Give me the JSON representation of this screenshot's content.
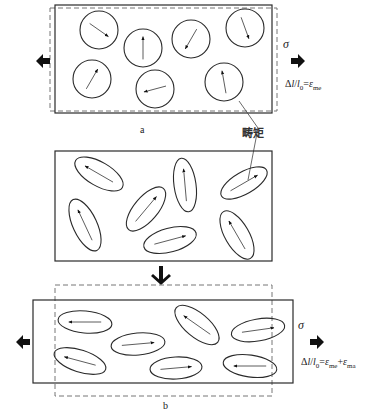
{
  "figure": {
    "colors": {
      "stroke": "#2a2a2a",
      "arrow": "#111111",
      "dash": "#777777",
      "background": "#ffffff"
    },
    "panel_a": {
      "label": "a",
      "stress_symbol": "σ",
      "strain_eq": {
        "prefix": "Δ",
        "l": "l",
        "slash": "/",
        "l0": "l",
        "l0_sub": "0",
        "eq": "=",
        "eps": "ε",
        "eps_sub": "me"
      },
      "rect_solid": [
        55,
        5,
        217,
        108
      ],
      "rect_dashed": [
        50,
        8,
        227,
        103
      ],
      "domains": [
        {
          "cx": 99,
          "cy": 30,
          "rx": 19,
          "ry": 19,
          "rot": 0,
          "angle": 35
        },
        {
          "cx": 143,
          "cy": 48,
          "rx": 19,
          "ry": 19,
          "rot": 0,
          "angle": -90
        },
        {
          "cx": 191,
          "cy": 39,
          "rx": 19,
          "ry": 19,
          "rot": 0,
          "angle": 120
        },
        {
          "cx": 245,
          "cy": 28,
          "rx": 19,
          "ry": 19,
          "rot": 0,
          "angle": 70
        },
        {
          "cx": 92,
          "cy": 79,
          "rx": 19,
          "ry": 19,
          "rot": 0,
          "angle": -60
        },
        {
          "cx": 155,
          "cy": 89,
          "rx": 19,
          "ry": 19,
          "rot": 0,
          "angle": 165
        },
        {
          "cx": 224,
          "cy": 82,
          "rx": 19,
          "ry": 19,
          "rot": 0,
          "angle": -100
        }
      ]
    },
    "annotation": {
      "text": "畴矩",
      "leader": [
        [
          239,
          101
        ],
        [
          258,
          128
        ],
        [
          248,
          180
        ]
      ]
    },
    "panel_middle": {
      "rect_solid": [
        55,
        151,
        217,
        110
      ],
      "domains": [
        {
          "cx": 99,
          "cy": 174,
          "rx": 27,
          "ry": 12,
          "rot": 30,
          "angle": 210
        },
        {
          "cx": 146,
          "cy": 209,
          "rx": 27,
          "ry": 12,
          "rot": -50,
          "angle": -50
        },
        {
          "cx": 185,
          "cy": 185,
          "rx": 27,
          "ry": 11,
          "rot": 82,
          "angle": -95
        },
        {
          "cx": 244,
          "cy": 183,
          "rx": 26,
          "ry": 11,
          "rot": -30,
          "angle": -30
        },
        {
          "cx": 85,
          "cy": 225,
          "rx": 28,
          "ry": 12,
          "rot": 65,
          "angle": -115
        },
        {
          "cx": 170,
          "cy": 240,
          "rx": 27,
          "ry": 12,
          "rot": -15,
          "angle": -15
        },
        {
          "cx": 237,
          "cy": 235,
          "rx": 27,
          "ry": 12,
          "rot": 60,
          "angle": -120
        }
      ]
    },
    "transition_arrow": {
      "x": 161,
      "y1": 266,
      "y2": 283
    },
    "panel_b": {
      "label": "b",
      "stress_symbol": "σ",
      "strain_eq": {
        "prefix": "Δ",
        "l": "l",
        "slash": "/",
        "l0": "l",
        "l0_sub": "0",
        "eq": "=",
        "eps": "ε",
        "eps_sub": "me",
        "plus": "+",
        "eps2": "ε",
        "eps2_sub": "ma"
      },
      "rect_solid": [
        33,
        300,
        260,
        83
      ],
      "rect_dashed": [
        55,
        285,
        217,
        111
      ],
      "domains": [
        {
          "cx": 85,
          "cy": 322,
          "rx": 27,
          "ry": 11,
          "rot": 5,
          "angle": 180
        },
        {
          "cx": 138,
          "cy": 344,
          "rx": 27,
          "ry": 11,
          "rot": -5,
          "angle": -5
        },
        {
          "cx": 80,
          "cy": 361,
          "rx": 27,
          "ry": 11,
          "rot": 18,
          "angle": 195
        },
        {
          "cx": 176,
          "cy": 368,
          "rx": 26,
          "ry": 11,
          "rot": -3,
          "angle": -5
        },
        {
          "cx": 197,
          "cy": 325,
          "rx": 27,
          "ry": 12,
          "rot": 40,
          "angle": 215
        },
        {
          "cx": 258,
          "cy": 330,
          "rx": 27,
          "ry": 11,
          "rot": -10,
          "angle": -8
        },
        {
          "cx": 250,
          "cy": 366,
          "rx": 27,
          "ry": 11,
          "rot": 8,
          "angle": 180
        }
      ]
    },
    "load_arrows": {
      "a": {
        "left": [
          36,
          61
        ],
        "right": [
          291,
          61
        ]
      },
      "b": {
        "left": [
          16,
          342
        ],
        "right": [
          310,
          342
        ]
      }
    }
  }
}
